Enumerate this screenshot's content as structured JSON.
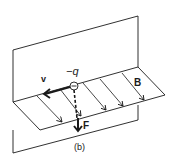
{
  "figure": {
    "caption": "(b)",
    "labels": {
      "charge": "−q",
      "velocity": "v",
      "field": "B",
      "force": "F"
    },
    "colors": {
      "ink": "#1a1a1a",
      "background": "#ffffff"
    }
  }
}
